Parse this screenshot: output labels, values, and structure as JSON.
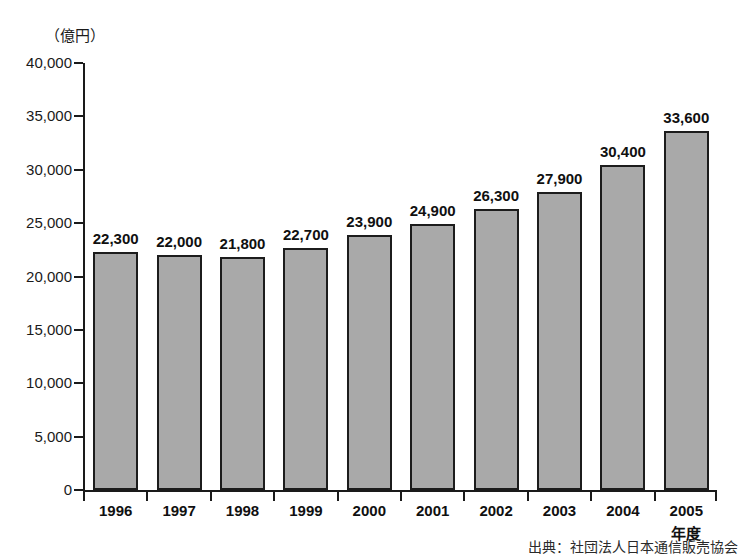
{
  "chart_data": {
    "type": "bar",
    "title": "",
    "subtitle": "",
    "unit_label": "（億円）",
    "xlabel": "",
    "ylabel": "",
    "categories": [
      "1996",
      "1997",
      "1998",
      "1999",
      "2000",
      "2001",
      "2002",
      "2003",
      "2004",
      "2005"
    ],
    "category_suffix": "年度",
    "values": [
      22300,
      22000,
      21800,
      22700,
      23900,
      24900,
      26300,
      27900,
      30400,
      33600
    ],
    "value_labels": [
      "22,300",
      "22,000",
      "21,800",
      "22,700",
      "23,900",
      "24,900",
      "26,300",
      "27,900",
      "30,400",
      "33,600"
    ],
    "ylim": [
      0,
      40000
    ],
    "y_ticks": [
      0,
      5000,
      10000,
      15000,
      20000,
      25000,
      30000,
      35000,
      40000
    ],
    "y_tick_labels": [
      "0",
      "5,000",
      "10,000",
      "15,000",
      "20,000",
      "25,000",
      "30,000",
      "35,000",
      "40,000"
    ],
    "grid": false,
    "legend": false,
    "legend_position": "none",
    "bar_fill_color": "#a9a9a9",
    "bar_edge_color": "#1c1c1c",
    "axis_color": "#1a1a1a",
    "background_color": "#ffffff",
    "source_note": "出典：社団法人日本通信販売協会"
  }
}
